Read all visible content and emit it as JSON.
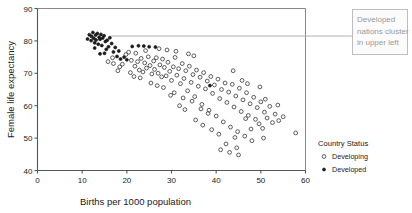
{
  "chart_data": {
    "type": "scatter",
    "title": "",
    "xlabel": "Births per 1000 population",
    "ylabel": "Female life expectancy",
    "xlim": [
      0,
      60
    ],
    "ylim": [
      40,
      90
    ],
    "xticks": [
      0,
      10,
      20,
      30,
      40,
      50,
      60
    ],
    "yticks": [
      40,
      50,
      60,
      70,
      80,
      90
    ],
    "grid": false,
    "legend": {
      "title": "Country Status",
      "position": "right",
      "entries": [
        {
          "label": "Developing",
          "marker": "open-circle"
        },
        {
          "label": "Developed",
          "marker": "filled-circle"
        }
      ]
    },
    "annotations": [
      {
        "text": "Developed nations cluster in upper left",
        "lines": [
          "Developed",
          "nations cluster",
          "in upper left"
        ],
        "leader_from": [
          16.5,
          81.5
        ],
        "leader_to": [
          62.0,
          81.5
        ],
        "color": "#9a9a9a",
        "border_color": "#bdbdbd"
      }
    ],
    "series": [
      {
        "name": "Developed",
        "marker": "filled-circle",
        "points": [
          [
            11.2,
            80.6
          ],
          [
            11.6,
            81.9
          ],
          [
            12.0,
            80.1
          ],
          [
            12.1,
            81.4
          ],
          [
            12.4,
            82.6
          ],
          [
            12.6,
            80.8
          ],
          [
            12.8,
            79.4
          ],
          [
            13.0,
            81.8
          ],
          [
            13.1,
            80.3
          ],
          [
            13.4,
            82.3
          ],
          [
            13.6,
            79.0
          ],
          [
            13.8,
            81.1
          ],
          [
            14.0,
            80.5
          ],
          [
            14.2,
            82.0
          ],
          [
            14.4,
            78.6
          ],
          [
            14.6,
            80.9
          ],
          [
            14.9,
            81.6
          ],
          [
            15.2,
            79.8
          ],
          [
            15.4,
            77.4
          ],
          [
            15.6,
            80.2
          ],
          [
            15.9,
            78.2
          ],
          [
            16.2,
            81.0
          ],
          [
            16.6,
            79.2
          ],
          [
            17.0,
            76.6
          ],
          [
            17.4,
            78.0
          ],
          [
            17.8,
            75.2
          ],
          [
            18.2,
            76.9
          ],
          [
            18.6,
            74.4
          ],
          [
            19.4,
            75.0
          ],
          [
            20.0,
            74.2
          ],
          [
            21.2,
            78.3
          ],
          [
            22.6,
            78.5
          ],
          [
            23.8,
            78.4
          ],
          [
            25.0,
            78.2
          ],
          [
            26.4,
            78.1
          ],
          [
            38.6,
            66.2
          ],
          [
            14.0,
            76.0
          ],
          [
            15.0,
            76.2
          ],
          [
            12.8,
            77.8
          ]
        ]
      },
      {
        "name": "Developing",
        "marker": "open-circle",
        "points": [
          [
            17.0,
            73.0
          ],
          [
            19.0,
            72.8
          ],
          [
            20.4,
            76.5
          ],
          [
            21.0,
            74.0
          ],
          [
            21.8,
            72.2
          ],
          [
            22.4,
            73.6
          ],
          [
            22.8,
            71.0
          ],
          [
            23.2,
            74.6
          ],
          [
            23.6,
            70.4
          ],
          [
            24.0,
            73.2
          ],
          [
            24.4,
            71.6
          ],
          [
            24.8,
            75.1
          ],
          [
            25.2,
            72.4
          ],
          [
            25.6,
            69.8
          ],
          [
            26.0,
            73.8
          ],
          [
            26.2,
            71.2
          ],
          [
            26.6,
            74.8
          ],
          [
            27.0,
            70.0
          ],
          [
            27.4,
            72.6
          ],
          [
            27.8,
            68.9
          ],
          [
            28.0,
            74.4
          ],
          [
            28.4,
            71.8
          ],
          [
            28.8,
            69.2
          ],
          [
            29.2,
            73.4
          ],
          [
            29.6,
            70.6
          ],
          [
            30.0,
            67.8
          ],
          [
            30.4,
            72.0
          ],
          [
            30.8,
            74.9
          ],
          [
            31.2,
            69.4
          ],
          [
            31.6,
            71.4
          ],
          [
            32.0,
            66.8
          ],
          [
            32.4,
            73.0
          ],
          [
            32.8,
            68.4
          ],
          [
            33.2,
            70.8
          ],
          [
            33.6,
            64.6
          ],
          [
            34.0,
            72.2
          ],
          [
            34.4,
            67.2
          ],
          [
            34.8,
            69.6
          ],
          [
            35.2,
            62.8
          ],
          [
            35.6,
            71.0
          ],
          [
            36.0,
            66.0
          ],
          [
            36.4,
            68.8
          ],
          [
            36.8,
            60.4
          ],
          [
            37.2,
            70.2
          ],
          [
            37.6,
            65.2
          ],
          [
            38.0,
            67.6
          ],
          [
            38.4,
            58.6
          ],
          [
            38.8,
            69.0
          ],
          [
            39.2,
            63.8
          ],
          [
            39.6,
            66.4
          ],
          [
            40.0,
            56.8
          ],
          [
            40.4,
            68.2
          ],
          [
            40.8,
            62.2
          ],
          [
            41.2,
            65.0
          ],
          [
            41.6,
            55.0
          ],
          [
            42.0,
            67.0
          ],
          [
            42.4,
            61.0
          ],
          [
            42.8,
            64.2
          ],
          [
            43.2,
            53.4
          ],
          [
            43.6,
            66.6
          ],
          [
            44.0,
            59.6
          ],
          [
            44.4,
            63.0
          ],
          [
            44.8,
            52.0
          ],
          [
            45.2,
            65.4
          ],
          [
            45.6,
            58.2
          ],
          [
            46.0,
            61.8
          ],
          [
            46.4,
            50.6
          ],
          [
            46.8,
            64.0
          ],
          [
            47.2,
            57.0
          ],
          [
            47.6,
            60.6
          ],
          [
            48.0,
            49.2
          ],
          [
            48.4,
            62.6
          ],
          [
            48.8,
            55.8
          ],
          [
            49.2,
            59.4
          ],
          [
            49.6,
            54.4
          ],
          [
            50.0,
            61.2
          ],
          [
            50.4,
            53.0
          ],
          [
            50.8,
            58.0
          ],
          [
            51.4,
            56.2
          ],
          [
            52.0,
            59.8
          ],
          [
            52.6,
            54.8
          ],
          [
            53.2,
            57.4
          ],
          [
            54.0,
            55.4
          ],
          [
            55.0,
            56.6
          ],
          [
            57.8,
            51.6
          ],
          [
            43.0,
            45.6
          ],
          [
            44.6,
            47.0
          ],
          [
            42.2,
            48.2
          ],
          [
            45.0,
            44.8
          ],
          [
            41.0,
            46.4
          ],
          [
            33.8,
            76.0
          ],
          [
            35.0,
            75.4
          ],
          [
            31.0,
            76.8
          ],
          [
            29.0,
            77.2
          ],
          [
            27.2,
            77.6
          ],
          [
            24.2,
            77.0
          ],
          [
            22.0,
            76.2
          ],
          [
            19.8,
            75.8
          ],
          [
            18.4,
            72.0
          ],
          [
            20.8,
            70.2
          ],
          [
            23.0,
            68.6
          ],
          [
            25.4,
            67.0
          ],
          [
            28.2,
            65.6
          ],
          [
            30.6,
            64.0
          ],
          [
            32.6,
            62.4
          ],
          [
            34.6,
            61.4
          ],
          [
            36.6,
            59.0
          ],
          [
            38.2,
            57.6
          ],
          [
            39.0,
            52.6
          ],
          [
            40.6,
            51.2
          ],
          [
            37.0,
            54.0
          ],
          [
            35.4,
            55.6
          ],
          [
            33.0,
            58.8
          ],
          [
            31.8,
            60.0
          ],
          [
            29.8,
            63.2
          ],
          [
            26.8,
            66.2
          ],
          [
            21.6,
            69.0
          ],
          [
            16.8,
            74.8
          ],
          [
            15.8,
            73.6
          ],
          [
            18.0,
            70.8
          ],
          [
            43.8,
            70.8
          ],
          [
            45.8,
            67.8
          ],
          [
            47.0,
            66.8
          ],
          [
            49.8,
            65.8
          ],
          [
            51.0,
            62.0
          ],
          [
            53.8,
            60.2
          ],
          [
            46.6,
            56.0
          ],
          [
            44.2,
            50.2
          ],
          [
            47.8,
            52.8
          ],
          [
            50.6,
            50.0
          ]
        ]
      }
    ]
  }
}
